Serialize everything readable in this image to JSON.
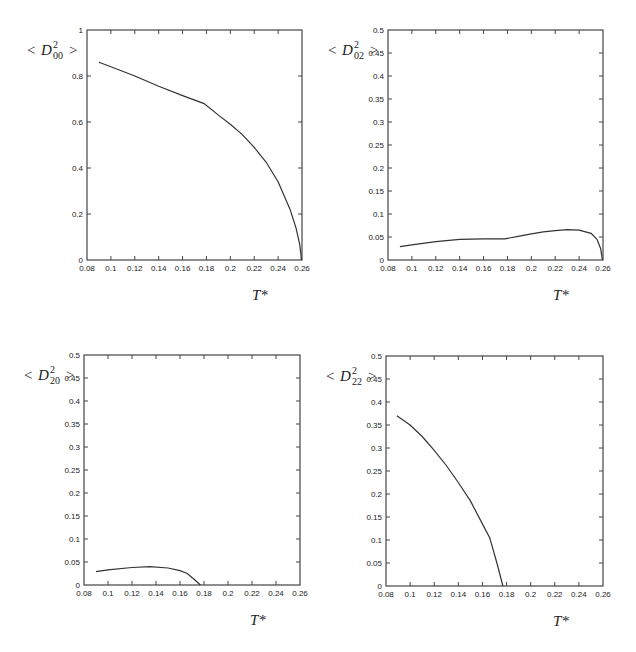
{
  "chart_data": [
    {
      "type": "line",
      "id": "D00",
      "ylabel_main": "D",
      "ylabel_sup": "2",
      "ylabel_sub": "00",
      "xlabel": "T*",
      "xlim": [
        0.08,
        0.26
      ],
      "ylim": [
        0,
        1
      ],
      "xticks": [
        "0.08",
        "0.1",
        "0.12",
        "0.14",
        "0.16",
        "0.18",
        "0.2",
        "0.22",
        "0.24",
        "0.26"
      ],
      "yticks": [
        "0",
        "0.2",
        "0.4",
        "0.6",
        "0.8",
        "1"
      ],
      "grid": false,
      "box": {
        "x0": 87,
        "y0": 30,
        "x1": 302,
        "y1": 260
      },
      "x": [
        0.09,
        0.1,
        0.12,
        0.14,
        0.16,
        0.178,
        0.19,
        0.2,
        0.21,
        0.22,
        0.23,
        0.24,
        0.25,
        0.255,
        0.258,
        0.259,
        0.2595
      ],
      "y": [
        0.86,
        0.84,
        0.8,
        0.755,
        0.715,
        0.68,
        0.63,
        0.59,
        0.545,
        0.49,
        0.425,
        0.34,
        0.22,
        0.14,
        0.07,
        0.03,
        0.0
      ]
    },
    {
      "type": "line",
      "id": "D02",
      "ylabel_main": "D",
      "ylabel_sup": "2",
      "ylabel_sub": "02",
      "xlabel": "T*",
      "xlim": [
        0.08,
        0.26
      ],
      "ylim": [
        0,
        0.5
      ],
      "xticks": [
        "0.08",
        "0.1",
        "0.12",
        "0.14",
        "0.16",
        "0.18",
        "0.2",
        "0.22",
        "0.24",
        "0.26"
      ],
      "yticks": [
        "0",
        "0.05",
        "0.1",
        "0.15",
        "0.2",
        "0.25",
        "0.3",
        "0.35",
        "0.4",
        "0.45",
        "0.5"
      ],
      "grid": false,
      "box": {
        "x0": 388,
        "y0": 30,
        "x1": 603,
        "y1": 260
      },
      "x": [
        0.09,
        0.1,
        0.12,
        0.14,
        0.16,
        0.178,
        0.19,
        0.2,
        0.21,
        0.22,
        0.23,
        0.24,
        0.25,
        0.255,
        0.258,
        0.2595
      ],
      "y": [
        0.029,
        0.033,
        0.04,
        0.045,
        0.046,
        0.046,
        0.052,
        0.057,
        0.061,
        0.064,
        0.066,
        0.065,
        0.058,
        0.045,
        0.025,
        0.0
      ]
    },
    {
      "type": "line",
      "id": "D20",
      "ylabel_main": "D",
      "ylabel_sup": "2",
      "ylabel_sub": "20",
      "xlabel": "T*",
      "xlim": [
        0.08,
        0.26
      ],
      "ylim": [
        0,
        0.5
      ],
      "xticks": [
        "0.08",
        "0.1",
        "0.12",
        "0.14",
        "0.16",
        "0.18",
        "0.2",
        "0.22",
        "0.24",
        "0.26"
      ],
      "yticks": [
        "0",
        "0.05",
        "0.1",
        "0.15",
        "0.2",
        "0.25",
        "0.3",
        "0.35",
        "0.4",
        "0.45",
        "0.5"
      ],
      "grid": false,
      "box": {
        "x0": 84,
        "y0": 355,
        "x1": 300,
        "y1": 585
      },
      "x": [
        0.09,
        0.1,
        0.12,
        0.135,
        0.15,
        0.16,
        0.166,
        0.172,
        0.177
      ],
      "y": [
        0.029,
        0.033,
        0.038,
        0.04,
        0.037,
        0.031,
        0.025,
        0.012,
        0.0
      ]
    },
    {
      "type": "line",
      "id": "D22",
      "ylabel_main": "D",
      "ylabel_sup": "2",
      "ylabel_sub": "22",
      "xlabel": "T*",
      "xlim": [
        0.08,
        0.26
      ],
      "ylim": [
        0,
        0.5
      ],
      "xticks": [
        "0.08",
        "0.1",
        "0.12",
        "0.14",
        "0.16",
        "0.18",
        "0.2",
        "0.22",
        "0.24",
        "0.26"
      ],
      "yticks": [
        "0",
        "0.05",
        "0.1",
        "0.15",
        "0.2",
        "0.25",
        "0.3",
        "0.35",
        "0.4",
        "0.45",
        "0.5"
      ],
      "grid": false,
      "box": {
        "x0": 386,
        "y0": 356,
        "x1": 603,
        "y1": 586
      },
      "x": [
        0.089,
        0.1,
        0.11,
        0.12,
        0.13,
        0.14,
        0.15,
        0.16,
        0.166,
        0.172,
        0.177
      ],
      "y": [
        0.37,
        0.35,
        0.325,
        0.295,
        0.262,
        0.225,
        0.185,
        0.135,
        0.105,
        0.05,
        0.0
      ]
    }
  ]
}
